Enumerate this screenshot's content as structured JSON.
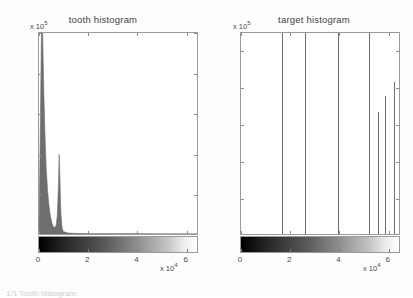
{
  "figure": {
    "background": "#fdfdfd",
    "axis_color": "#9a9a9a",
    "line_color": "#6e6e6e",
    "colormap": "grayscale",
    "caption_partial": "1/1 Tooth histogram"
  },
  "panels": [
    {
      "id": "tooth",
      "title": "tooth histogram",
      "y_multiplier": "x 10",
      "y_exponent": "5",
      "x_multiplier": "x 10",
      "x_exponent": "4",
      "colorbar_name": "grayscale-colorbar"
    },
    {
      "id": "target",
      "title": "target histogram",
      "y_multiplier": "x 10",
      "y_exponent": "5",
      "x_multiplier": "x 10",
      "x_exponent": "4",
      "colorbar_name": "grayscale-colorbar"
    }
  ],
  "chart_data": [
    {
      "type": "area",
      "id": "tooth-histogram",
      "title": "tooth histogram",
      "xlabel": "",
      "ylabel": "",
      "xlim": [
        0,
        65000
      ],
      "ylim": [
        0,
        250000
      ],
      "x_tick_labels": [
        "0",
        "2",
        "4",
        "6"
      ],
      "x_tick_values": [
        0,
        20000,
        40000,
        60000
      ],
      "y_tick_labels": [
        "0",
        "0.5",
        "1",
        "1.5",
        "2",
        "2.5"
      ],
      "y_tick_values": [
        0,
        50000,
        100000,
        150000,
        200000,
        250000
      ],
      "x_tick_multiplier": 10000,
      "y_tick_multiplier": 100000,
      "grid": false,
      "legend": "none",
      "note": "Tall narrow peak clipped at axis top near x=1500; secondary peak near x=8500 reaching ~1.0e5",
      "x": [
        0,
        500,
        1000,
        1500,
        2000,
        2500,
        3000,
        3500,
        4000,
        4500,
        5000,
        5500,
        6000,
        6500,
        7000,
        7500,
        8000,
        8300,
        8600,
        9000,
        9500,
        10000,
        12000,
        15000,
        20000,
        30000,
        40000,
        50000,
        60000,
        65000
      ],
      "y": [
        10000,
        120000,
        250000,
        255000,
        175000,
        120000,
        80000,
        55000,
        38000,
        26000,
        18000,
        12000,
        9000,
        8000,
        10000,
        22000,
        60000,
        99000,
        70000,
        26000,
        8000,
        3000,
        1200,
        700,
        400,
        250,
        180,
        140,
        110,
        90
      ]
    },
    {
      "type": "bar",
      "id": "target-histogram",
      "title": "target histogram",
      "xlabel": "",
      "ylabel": "",
      "xlim": [
        0,
        65000
      ],
      "ylim": [
        0,
        275000
      ],
      "x_tick_labels": [
        "0",
        "2",
        "4",
        "6"
      ],
      "x_tick_values": [
        0,
        20000,
        40000,
        60000
      ],
      "y_tick_labels": [
        "0",
        "0.5",
        "1",
        "1.5",
        "2",
        "2.5"
      ],
      "y_tick_values": [
        0,
        50000,
        100000,
        150000,
        200000,
        250000
      ],
      "x_tick_multiplier": 10000,
      "y_tick_multiplier": 100000,
      "grid": false,
      "legend": "none",
      "note": "Seven discrete impulses; first four clipped at axis top",
      "categories": [
        16500,
        26000,
        39500,
        52000,
        55500,
        58500,
        62000
      ],
      "values": [
        275000,
        275000,
        275000,
        275000,
        165000,
        187000,
        206000
      ]
    }
  ]
}
